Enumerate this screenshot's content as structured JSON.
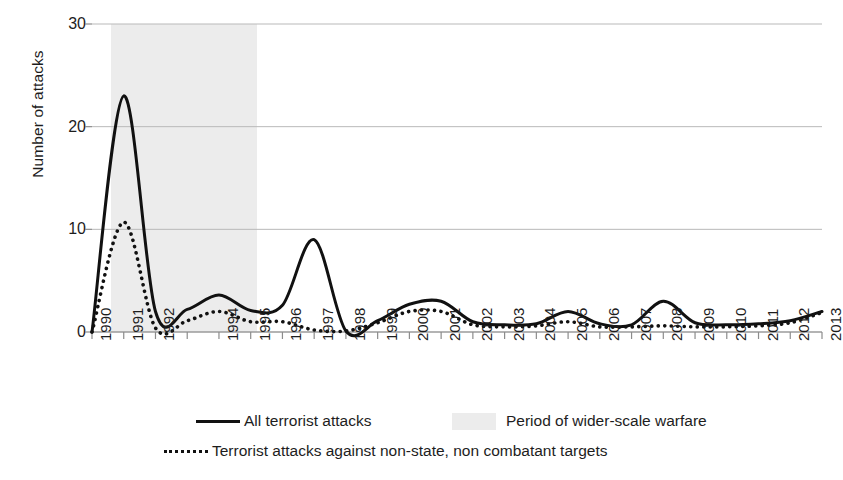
{
  "chart_data": {
    "type": "line",
    "title": "",
    "xlabel": "",
    "ylabel": "Number of attacks",
    "ylim": [
      0,
      30
    ],
    "yticks": [
      0,
      10,
      20,
      30
    ],
    "grid": true,
    "legend_position": "bottom",
    "x": [
      1990,
      1991,
      1992,
      1993,
      1994,
      1995,
      1996,
      1997,
      1998,
      1999,
      2000,
      2001,
      2002,
      2003,
      2004,
      2005,
      2006,
      2007,
      2008,
      2009,
      2010,
      2011,
      2012,
      2013
    ],
    "xtick_labels": [
      "1990",
      "1991",
      "1992",
      "1994",
      "1995",
      "1996",
      "1997",
      "1998",
      "1999",
      "2000",
      "2001",
      "2002",
      "2003",
      "2004",
      "2005",
      "2006",
      "2007",
      "2008",
      "2009",
      "2010",
      "2011",
      "2012",
      "2013"
    ],
    "series": [
      {
        "name": "All terrorist attacks",
        "style": "solid",
        "color": "#111111",
        "values": [
          0,
          23,
          2,
          2.2,
          3.6,
          2.1,
          2.6,
          9,
          0.1,
          1.1,
          2.7,
          3,
          1,
          0.7,
          0.8,
          2,
          0.8,
          0.7,
          3,
          0.9,
          0.7,
          0.8,
          1.1,
          2
        ]
      },
      {
        "name": "Terrorist attacks against non-state, non combatant targets",
        "style": "dotted",
        "color": "#111111",
        "values": [
          0,
          10.7,
          0.4,
          1.1,
          2.0,
          1.0,
          1.0,
          0.2,
          0.1,
          0.9,
          2.0,
          2.0,
          0.7,
          0.5,
          0.6,
          1.0,
          0.5,
          0.5,
          0.6,
          0.5,
          0.5,
          0.6,
          0.9,
          1.9
        ]
      }
    ],
    "shaded_region": {
      "label": "Period of wider-scale warfare",
      "color": "#ececec",
      "x_start": 1990.6,
      "x_end": 1995.2
    }
  },
  "legend": {
    "all_attacks": "All terrorist attacks",
    "warfare_period": "Period of wider-scale warfare",
    "nonstate_targets": "Terrorist attacks against non-state, non combatant targets"
  },
  "axes": {
    "y_title": "Number of attacks"
  }
}
